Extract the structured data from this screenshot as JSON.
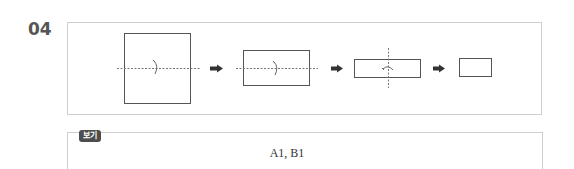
{
  "question": {
    "number": "04"
  },
  "diagram": {
    "steps": [
      {
        "shape": "square",
        "fold_line": "horizontal-dashed",
        "fold_arrow": "curved-down"
      },
      {
        "shape": "wide-rectangle",
        "fold_line": "horizontal-dashed",
        "fold_arrow": "curved-down"
      },
      {
        "shape": "thin-rectangle",
        "fold_line": "vertical-dashed",
        "fold_arrow": "curved-left"
      },
      {
        "shape": "small-rectangle",
        "fold_line": "none",
        "fold_arrow": "none"
      }
    ],
    "arrow_icon": "right-arrow-icon",
    "line_color": "#555555",
    "dash_color": "#777777"
  },
  "bogi": {
    "label": "보기",
    "content": "A1,  B1",
    "badge_color": "#4d4d4d"
  }
}
